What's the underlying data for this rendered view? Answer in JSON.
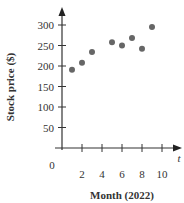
{
  "chart_data": {
    "type": "scatter",
    "title": "",
    "xlabel": "Month (2022)",
    "ylabel": "Stock price ($)",
    "x_axis_var": "t",
    "origin_label": "0",
    "xlim": [
      0,
      11
    ],
    "ylim": [
      0,
      330
    ],
    "x_ticks": [
      1,
      2,
      3,
      4,
      5,
      6,
      7,
      8,
      9,
      10
    ],
    "x_tick_labels": [
      "2",
      "4",
      "6",
      "8",
      "10"
    ],
    "y_ticks": [
      50,
      100,
      150,
      200,
      250,
      300
    ],
    "y_tick_labels": [
      "50",
      "100",
      "150",
      "200",
      "250",
      "300"
    ],
    "grid": false,
    "legend": null,
    "points": [
      {
        "x": 1,
        "y": 191
      },
      {
        "x": 2,
        "y": 208
      },
      {
        "x": 3,
        "y": 234
      },
      {
        "x": 5,
        "y": 258
      },
      {
        "x": 6,
        "y": 250
      },
      {
        "x": 7,
        "y": 268
      },
      {
        "x": 8,
        "y": 242
      },
      {
        "x": 9,
        "y": 295
      }
    ],
    "marker_color": "#666666"
  }
}
